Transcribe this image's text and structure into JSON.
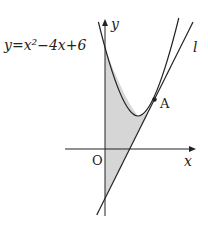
{
  "diagram": {
    "equation_label": "y=x²−4x+6",
    "y_axis_label": "y",
    "x_axis_label": "x",
    "origin_label": "O",
    "tangent_label": "l",
    "point_label": "A",
    "y_intercept_value": "6",
    "colors": {
      "shade": "#d6d6d6",
      "line": "#222222"
    }
  }
}
